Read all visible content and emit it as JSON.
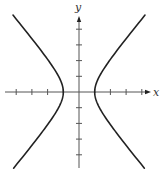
{
  "chart_data": {
    "type": "line",
    "title": "",
    "xlabel": "x",
    "ylabel": "y",
    "equation": "x^2 - y^2/1.44 = 1",
    "xlim": [
      -5,
      4.6
    ],
    "ylim": [
      -4.8,
      5
    ],
    "x_ticks": [
      -4,
      -3,
      -2,
      -1,
      1,
      2,
      3,
      4
    ],
    "y_ticks": [
      -4,
      -3,
      -2,
      -1,
      1,
      2,
      3,
      4
    ],
    "tick_labels_shown": false,
    "grid": false,
    "legend": null,
    "series": [
      {
        "name": "right branch",
        "x": [
          4.2,
          3.0,
          2.0,
          1.5,
          1.2,
          1.0,
          1.2,
          1.5,
          2.0,
          3.0,
          4.3
        ],
        "y": [
          4.9,
          3.4,
          2.1,
          1.3,
          0.8,
          0.0,
          -0.8,
          -1.3,
          -2.1,
          -3.4,
          -4.8
        ]
      },
      {
        "name": "left branch",
        "x": [
          -4.3,
          -3.0,
          -2.0,
          -1.5,
          -1.2,
          -1.0,
          -1.2,
          -1.5,
          -2.0,
          -3.0,
          -4.3
        ],
        "y": [
          4.8,
          3.4,
          2.1,
          1.3,
          0.8,
          0.0,
          -0.8,
          -1.3,
          -2.1,
          -3.4,
          -4.8
        ]
      }
    ],
    "vertices": [
      [
        -1,
        0
      ],
      [
        1,
        0
      ]
    ],
    "layout": {
      "origin_px": [
        79,
        92
      ],
      "unit_px": 15.7,
      "x_axis_px": [
        5,
        151
      ],
      "y_axis_px": [
        16,
        168
      ]
    }
  },
  "labels": {
    "x_axis": "x",
    "y_axis": "y"
  },
  "colors": {
    "curve": "#222222",
    "axis": "#555555",
    "background": "#ffffff"
  }
}
